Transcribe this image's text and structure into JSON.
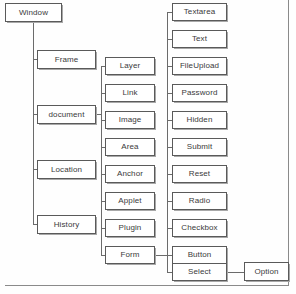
{
  "diagram": {
    "type": "tree-diagram",
    "orientation": "left-to-right",
    "colors": {
      "node_border": "#5a5a5a",
      "node_fill": "#ffffff",
      "node_text": "#3a3a3a",
      "edge": "#6b6b6b",
      "shadow": "#a8a8a8",
      "background": "#fefefe"
    },
    "levels": [
      {
        "level": 1,
        "name": "root",
        "nodes": [
          {
            "id": "window",
            "label": "Window",
            "x": 5,
            "y": 3,
            "w": 57,
            "h": 19
          }
        ]
      },
      {
        "level": 2,
        "name": "window-children",
        "parent": "window",
        "nodes": [
          {
            "id": "frame",
            "label": "Frame",
            "x": 37,
            "y": 50,
            "w": 59,
            "h": 19
          },
          {
            "id": "document",
            "label": "document",
            "x": 37,
            "y": 105,
            "w": 59,
            "h": 19
          },
          {
            "id": "location",
            "label": "Location",
            "x": 37,
            "y": 160,
            "w": 59,
            "h": 19
          },
          {
            "id": "history",
            "label": "History",
            "x": 37,
            "y": 215,
            "w": 59,
            "h": 19
          }
        ]
      },
      {
        "level": 3,
        "name": "document-children",
        "parent": "document",
        "nodes": [
          {
            "id": "layer",
            "label": "Layer",
            "x": 105,
            "y": 57,
            "w": 50,
            "h": 18
          },
          {
            "id": "link",
            "label": "Link",
            "x": 105,
            "y": 84,
            "w": 50,
            "h": 18
          },
          {
            "id": "image",
            "label": "Image",
            "x": 105,
            "y": 111,
            "w": 50,
            "h": 18
          },
          {
            "id": "area",
            "label": "Area",
            "x": 105,
            "y": 138,
            "w": 50,
            "h": 18
          },
          {
            "id": "anchor",
            "label": "Anchor",
            "x": 105,
            "y": 165,
            "w": 50,
            "h": 18
          },
          {
            "id": "applet",
            "label": "Applet",
            "x": 105,
            "y": 192,
            "w": 50,
            "h": 18
          },
          {
            "id": "plugin",
            "label": "Plugin",
            "x": 105,
            "y": 219,
            "w": 50,
            "h": 18
          },
          {
            "id": "form",
            "label": "Form",
            "x": 105,
            "y": 246,
            "w": 50,
            "h": 18
          }
        ]
      },
      {
        "level": 4,
        "name": "form-children",
        "parent": "form",
        "nodes": [
          {
            "id": "textarea",
            "label": "Textarea",
            "x": 172,
            "y": 3,
            "w": 55,
            "h": 18
          },
          {
            "id": "text",
            "label": "Text",
            "x": 172,
            "y": 30,
            "w": 55,
            "h": 18
          },
          {
            "id": "fileupload",
            "label": "FileUpload",
            "x": 172,
            "y": 57,
            "w": 55,
            "h": 18
          },
          {
            "id": "password",
            "label": "Password",
            "x": 172,
            "y": 84,
            "w": 55,
            "h": 18
          },
          {
            "id": "hidden",
            "label": "Hidden",
            "x": 172,
            "y": 111,
            "w": 55,
            "h": 18
          },
          {
            "id": "submit",
            "label": "Submit",
            "x": 172,
            "y": 138,
            "w": 55,
            "h": 18
          },
          {
            "id": "reset",
            "label": "Reset",
            "x": 172,
            "y": 165,
            "w": 55,
            "h": 18
          },
          {
            "id": "radio",
            "label": "Radio",
            "x": 172,
            "y": 192,
            "w": 55,
            "h": 18
          },
          {
            "id": "checkbox",
            "label": "Checkbox",
            "x": 172,
            "y": 219,
            "w": 55,
            "h": 18
          },
          {
            "id": "button",
            "label": "Button",
            "x": 172,
            "y": 246,
            "w": 55,
            "h": 18
          },
          {
            "id": "select",
            "label": "Select",
            "x": 172,
            "y": 263,
            "w": 55,
            "h": 18
          }
        ]
      },
      {
        "level": 5,
        "name": "select-children",
        "parent": "select",
        "nodes": [
          {
            "id": "option",
            "label": "Option",
            "x": 244,
            "y": 262,
            "w": 45,
            "h": 19
          }
        ]
      }
    ],
    "labels": {
      "window": "Window",
      "frame": "Frame",
      "document": "document",
      "location": "Location",
      "history": "History",
      "layer": "Layer",
      "link": "Link",
      "image": "Image",
      "area": "Area",
      "anchor": "Anchor",
      "applet": "Applet",
      "plugin": "Plugin",
      "form": "Form",
      "textarea": "Textarea",
      "text": "Text",
      "fileupload": "FileUpload",
      "password": "Password",
      "hidden": "Hidden",
      "submit": "Submit",
      "reset": "Reset",
      "radio": "Radio",
      "checkbox": "Checkbox",
      "button": "Button",
      "select": "Select",
      "option": "Option"
    }
  }
}
